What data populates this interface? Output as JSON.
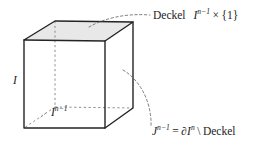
{
  "figure": {
    "name": "cube-diagram-deckel",
    "background_color": "#ffffff",
    "ink_color": "#1c1c1c",
    "top_face_fill": "#e8e8e8",
    "edge_color": "#242424",
    "hidden_edge_color": "#8c8c8c"
  },
  "labels": {
    "deckel_top": {
      "word": "Deckel",
      "symbol_base": "I",
      "symbol_exponent": "n−1",
      "operator": "×",
      "set": "{1}",
      "full_text": "Deckel I^{n-1} × {1}"
    },
    "j_boundary": {
      "symbol_base": "J",
      "symbol_exponent": "n−1",
      "equals": "=",
      "boundary_operator": "∂",
      "boundary_base": "I",
      "boundary_exponent": "n",
      "setminus": "\\",
      "word": "Deckel",
      "full_text": "J^{n-1} = ∂I^n \\ Deckel"
    },
    "interval_left": {
      "symbol": "I",
      "full_text": "I"
    },
    "base_face": {
      "symbol_base": "I",
      "symbol_exponent": "n−1",
      "full_text": "I^{n-1}"
    }
  },
  "geometry": {
    "front_top_left": [
      24,
      40
    ],
    "front_top_right": [
      105,
      41
    ],
    "front_bottom_left": [
      24,
      128
    ],
    "front_bottom_right": [
      105,
      128
    ],
    "back_top_left": [
      55,
      21
    ],
    "back_top_right": [
      133,
      22
    ],
    "back_bottom_left": [
      55,
      107
    ],
    "back_bottom_right": [
      133,
      108
    ],
    "leader_top": {
      "from": [
        89,
        27
      ],
      "to": [
        150,
        16
      ]
    },
    "leader_bottom": {
      "from": [
        123,
        70
      ],
      "to": [
        151,
        128
      ]
    }
  }
}
